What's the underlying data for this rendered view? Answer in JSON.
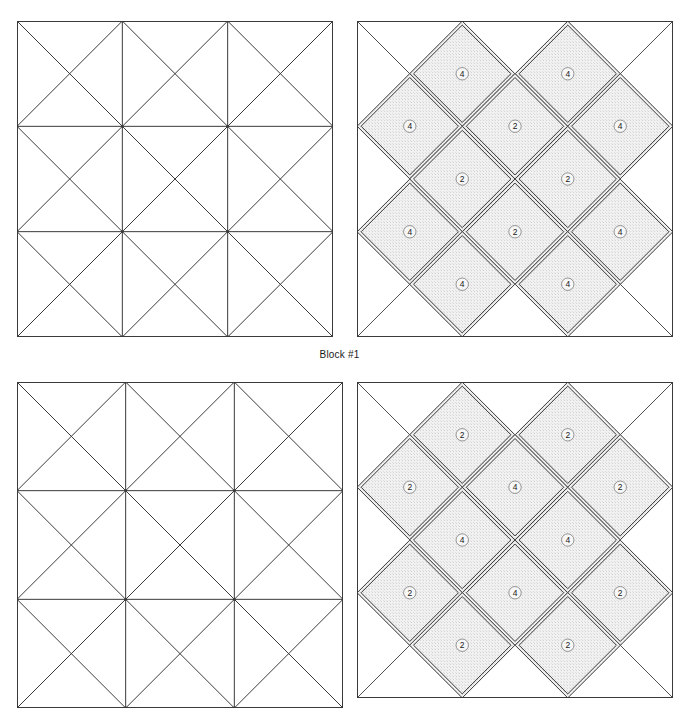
{
  "page": {
    "background_color": "#ffffff",
    "line_color": "#3a3a3a",
    "shade_color": "#f1f1f1",
    "shade_stipple_color": "#cfcfcf",
    "label_color": "#1a1a1a",
    "width": 679,
    "height": 721
  },
  "captions": {
    "block1": "Block #1"
  },
  "layout": {
    "blocks": [
      {
        "id": "block1-draft",
        "name": "block-1-piecing-grid",
        "kind": "grid",
        "x": 17,
        "y": 21,
        "size": 316,
        "row": 1,
        "col": 1
      },
      {
        "id": "block1-pieces",
        "name": "block-1-piece-layout",
        "kind": "pieces",
        "x": 357,
        "y": 21,
        "size": 316,
        "row": 1,
        "col": 2
      },
      {
        "id": "block2-draft",
        "name": "block-2-piecing-grid",
        "kind": "grid",
        "x": 17,
        "y": 382,
        "size": 326,
        "row": 2,
        "col": 1
      },
      {
        "id": "block2-pieces",
        "name": "block-2-piece-layout",
        "kind": "pieces",
        "x": 357,
        "y": 382,
        "size": 316,
        "row": 2,
        "col": 2
      }
    ]
  },
  "chart_data": {
    "type": "diagram",
    "grid_divisions": 3,
    "blocks": [
      {
        "label": "Block #1",
        "draft_cells": [
          {
            "row": 0,
            "col": 0,
            "diagonals": "both"
          },
          {
            "row": 0,
            "col": 1,
            "diagonals": "both"
          },
          {
            "row": 0,
            "col": 2,
            "diagonals": "both"
          },
          {
            "row": 1,
            "col": 0,
            "diagonals": "both"
          },
          {
            "row": 1,
            "col": 1,
            "diagonals": "both"
          },
          {
            "row": 1,
            "col": 2,
            "diagonals": "both"
          },
          {
            "row": 2,
            "col": 0,
            "diagonals": "both"
          },
          {
            "row": 2,
            "col": 1,
            "diagonals": "both"
          },
          {
            "row": 2,
            "col": 2,
            "diagonals": "both"
          }
        ],
        "draft_inner_verticals": [
          1,
          2
        ],
        "draft_inner_horizontals": [
          1,
          2
        ],
        "pieces": [
          {
            "label": "4",
            "cx": 0.333,
            "cy": 0.167,
            "shape": "diamond"
          },
          {
            "label": "4",
            "cx": 0.667,
            "cy": 0.167,
            "shape": "diamond"
          },
          {
            "label": "4",
            "cx": 0.167,
            "cy": 0.333,
            "shape": "diamond"
          },
          {
            "label": "2",
            "cx": 0.5,
            "cy": 0.333,
            "shape": "diamond"
          },
          {
            "label": "4",
            "cx": 0.833,
            "cy": 0.333,
            "shape": "diamond"
          },
          {
            "label": "2",
            "cx": 0.333,
            "cy": 0.5,
            "shape": "diamond"
          },
          {
            "label": "2",
            "cx": 0.667,
            "cy": 0.5,
            "shape": "diamond"
          },
          {
            "label": "4",
            "cx": 0.167,
            "cy": 0.667,
            "shape": "diamond"
          },
          {
            "label": "2",
            "cx": 0.5,
            "cy": 0.667,
            "shape": "diamond"
          },
          {
            "label": "4",
            "cx": 0.833,
            "cy": 0.667,
            "shape": "diamond"
          },
          {
            "label": "4",
            "cx": 0.333,
            "cy": 0.833,
            "shape": "diamond"
          },
          {
            "label": "4",
            "cx": 0.667,
            "cy": 0.833,
            "shape": "diamond"
          }
        ],
        "piece_counts": {
          "2": 4,
          "4": 8
        }
      },
      {
        "label": "",
        "draft_cells": [
          {
            "row": 0,
            "col": 0,
            "diagonals": "both"
          },
          {
            "row": 0,
            "col": 1,
            "diagonals": "both"
          },
          {
            "row": 0,
            "col": 2,
            "diagonals": "both"
          },
          {
            "row": 1,
            "col": 0,
            "diagonals": "both"
          },
          {
            "row": 1,
            "col": 1,
            "diagonals": "both"
          },
          {
            "row": 1,
            "col": 2,
            "diagonals": "both"
          },
          {
            "row": 2,
            "col": 0,
            "diagonals": "both"
          },
          {
            "row": 2,
            "col": 1,
            "diagonals": "both"
          },
          {
            "row": 2,
            "col": 2,
            "diagonals": "both"
          }
        ],
        "draft_inner_verticals": [
          1,
          2
        ],
        "draft_inner_horizontals": [
          1,
          2
        ],
        "pieces": [
          {
            "label": "2",
            "cx": 0.333,
            "cy": 0.167,
            "shape": "diamond"
          },
          {
            "label": "2",
            "cx": 0.667,
            "cy": 0.167,
            "shape": "diamond"
          },
          {
            "label": "2",
            "cx": 0.167,
            "cy": 0.333,
            "shape": "diamond"
          },
          {
            "label": "4",
            "cx": 0.5,
            "cy": 0.333,
            "shape": "diamond"
          },
          {
            "label": "2",
            "cx": 0.833,
            "cy": 0.333,
            "shape": "diamond"
          },
          {
            "label": "4",
            "cx": 0.333,
            "cy": 0.5,
            "shape": "diamond"
          },
          {
            "label": "4",
            "cx": 0.667,
            "cy": 0.5,
            "shape": "diamond"
          },
          {
            "label": "2",
            "cx": 0.167,
            "cy": 0.667,
            "shape": "diamond"
          },
          {
            "label": "4",
            "cx": 0.5,
            "cy": 0.667,
            "shape": "diamond"
          },
          {
            "label": "2",
            "cx": 0.833,
            "cy": 0.667,
            "shape": "diamond"
          },
          {
            "label": "2",
            "cx": 0.333,
            "cy": 0.833,
            "shape": "diamond"
          },
          {
            "label": "2",
            "cx": 0.667,
            "cy": 0.833,
            "shape": "diamond"
          }
        ],
        "piece_counts": {
          "2": 8,
          "4": 4
        }
      }
    ]
  }
}
